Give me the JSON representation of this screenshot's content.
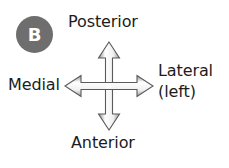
{
  "figure": {
    "panel_letter": "B",
    "background_color": "#ffffff",
    "badge_color": "#6e6e6e",
    "badge_text_color": "#ffffff",
    "text_color": "#1c1c1c",
    "arrow_stroke_color": "#5a5a5a",
    "arrow_fill_color": "#f2f2f2"
  },
  "labels": {
    "posterior": "Posterior",
    "anterior": "Anterior",
    "medial": "Medial",
    "lateral": "Lateral",
    "lateral_qualifier": "(left)"
  },
  "icons": {
    "cross_arrow": "four-way-arrow-icon"
  }
}
